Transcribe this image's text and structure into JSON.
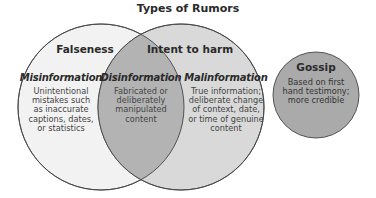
{
  "diagram": {
    "title": "Types of Rumors",
    "type": "venn",
    "colors": {
      "left_circle": "#f2f2f2",
      "right_circle": "#d9d9d9",
      "intersection": "#b3b3b3",
      "gossip_circle": "#aaaaaa",
      "stroke": "#444444"
    },
    "sets": [
      {
        "label": "Falseness"
      },
      {
        "label": "Intent to harm"
      }
    ],
    "regions": [
      {
        "name": "Misinformation",
        "description": "Unintentional mistakes such as inaccurate captions, dates, or statistics"
      },
      {
        "name": "Disinformation",
        "description": "Fabricated or deliberately manipulated content"
      },
      {
        "name": "Malinformation",
        "description": "True information; deliberate change of context, date, or time of genuine content"
      }
    ],
    "separate": {
      "name": "Gossip",
      "description": "Based on first hand testimony; more credible"
    }
  }
}
